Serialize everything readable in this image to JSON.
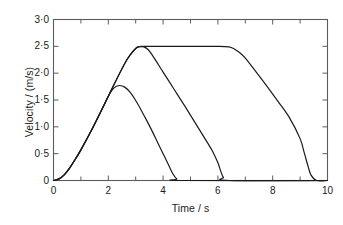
{
  "chart_data": {
    "type": "line",
    "title": "",
    "xlabel": "Time / s",
    "ylabel": "Velocity / (m/s)",
    "xlim": [
      0,
      10
    ],
    "ylim": [
      0,
      3.0
    ],
    "grid": false,
    "legend": "none",
    "axis_frame": "box",
    "xticks": [
      0,
      2,
      4,
      6,
      8,
      10
    ],
    "xtick_labels": [
      "0",
      "2",
      "4",
      "6",
      "8",
      "10"
    ],
    "xminor_tick_interval": 1,
    "yticks": [
      0,
      0.5,
      1.0,
      1.5,
      2.0,
      2.5,
      3.0
    ],
    "ytick_labels": [
      "0",
      "0·5",
      "1·0",
      "1·5",
      "2·0",
      "2·5",
      "3·0"
    ],
    "line_color": "#1a1a1a",
    "line_width": 1.2,
    "series": [
      {
        "name": "short-trip",
        "description": "Smallest trapezoid: accelerates from rest, rounded peak near 1.77 m/s at t=2.4 s, then decelerates to rest at t=4.5 s",
        "peak_value": 1.77,
        "x": [
          0.0,
          0.2,
          0.4,
          0.6,
          0.8,
          1.0,
          1.2,
          1.4,
          1.6,
          1.8,
          2.0,
          2.2,
          2.4,
          2.6,
          2.8,
          3.0,
          3.2,
          3.4,
          3.6,
          3.8,
          4.0,
          4.2,
          4.35,
          4.5,
          4.7,
          10.0
        ],
        "y": [
          0.0,
          0.03,
          0.11,
          0.24,
          0.4,
          0.57,
          0.76,
          0.95,
          1.15,
          1.36,
          1.57,
          1.72,
          1.77,
          1.74,
          1.64,
          1.49,
          1.31,
          1.12,
          0.92,
          0.71,
          0.5,
          0.29,
          0.13,
          0.03,
          0.0,
          0.0
        ]
      },
      {
        "name": "medium-trip",
        "description": "Medium trapezoid: same acceleration ramp, short rounded plateau at 2.5 m/s near t=3.2 s, then long linear deceleration to rest at t=6.2 s",
        "peak_value": 2.5,
        "x": [
          0.0,
          0.2,
          0.4,
          0.6,
          0.8,
          1.0,
          1.4,
          1.8,
          2.2,
          2.6,
          2.8,
          3.0,
          3.1,
          3.2,
          3.3,
          3.45,
          3.6,
          4.0,
          4.4,
          4.8,
          5.2,
          5.6,
          5.8,
          6.0,
          6.1,
          6.2,
          6.4,
          10.0
        ],
        "y": [
          0.0,
          0.03,
          0.11,
          0.24,
          0.4,
          0.57,
          0.95,
          1.36,
          1.78,
          2.18,
          2.34,
          2.46,
          2.49,
          2.5,
          2.49,
          2.44,
          2.34,
          2.02,
          1.7,
          1.38,
          1.05,
          0.72,
          0.55,
          0.33,
          0.18,
          0.06,
          0.0,
          0.0
        ]
      },
      {
        "name": "long-trip",
        "description": "Largest trapezoid: same acceleration ramp to 2.5 m/s, long cruise plateau from t=3.1 s to t=6.5 s, then decelerates to rest at t=9.4 s",
        "peak_value": 2.5,
        "x": [
          0.0,
          0.2,
          0.4,
          0.6,
          0.8,
          1.0,
          1.4,
          1.8,
          2.2,
          2.6,
          2.8,
          3.0,
          3.1,
          3.3,
          4.0,
          5.0,
          6.0,
          6.4,
          6.6,
          6.8,
          7.0,
          7.4,
          7.8,
          8.2,
          8.6,
          9.0,
          9.15,
          9.3,
          9.4,
          9.6,
          10.0
        ],
        "y": [
          0.0,
          0.03,
          0.11,
          0.24,
          0.4,
          0.57,
          0.95,
          1.36,
          1.78,
          2.18,
          2.34,
          2.46,
          2.49,
          2.5,
          2.5,
          2.5,
          2.5,
          2.49,
          2.45,
          2.38,
          2.28,
          2.02,
          1.75,
          1.47,
          1.18,
          0.78,
          0.52,
          0.25,
          0.1,
          0.0,
          0.0
        ]
      }
    ]
  },
  "axes": {
    "x_axis_title": "Time / s",
    "y_axis_title": "Velocity / (m/s)"
  }
}
